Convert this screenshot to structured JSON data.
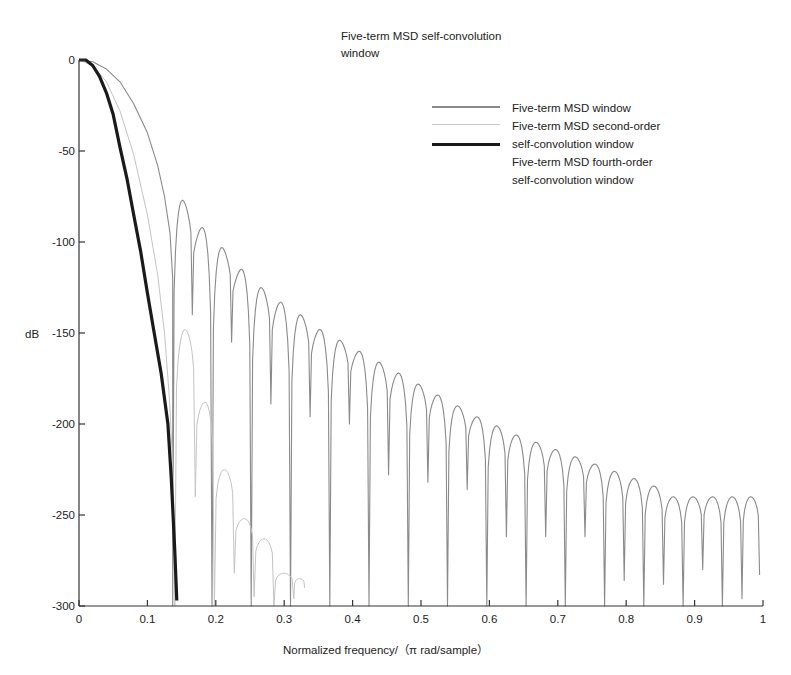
{
  "chart_data": {
    "type": "line",
    "title": "Five-term MSD self-convolution window",
    "xlabel": "Normalized frequency/（π rad/sample）",
    "ylabel": "dB",
    "xlim": [
      0,
      1
    ],
    "ylim": [
      -300,
      0
    ],
    "grid": false,
    "legend_position": "upper right",
    "x_ticks": [
      0,
      0.1,
      0.2,
      0.3,
      0.4,
      0.5,
      0.6,
      0.7,
      0.8,
      0.9,
      1
    ],
    "x_tick_labels": [
      "0",
      "0.1",
      "0.2",
      "0.3",
      "0.4",
      "0.5",
      "0.6",
      "0.7",
      "0.8",
      "0.9",
      "1"
    ],
    "y_ticks": [
      0,
      -50,
      -100,
      -150,
      -200,
      -250,
      -300
    ],
    "y_tick_labels": [
      "0",
      "-50",
      "-100",
      "-150",
      "-200",
      "-250",
      "-300"
    ],
    "series": [
      {
        "name": "Five-term MSD window",
        "color": "#8a8a8a",
        "line_width": 1.1,
        "mainlobe": {
          "x": [
            0,
            0.02,
            0.04,
            0.06,
            0.08,
            0.1,
            0.115,
            0.125,
            0.133,
            0.137
          ],
          "y": [
            0,
            -1,
            -5,
            -12,
            -24,
            -40,
            -58,
            -75,
            -95,
            -120
          ]
        },
        "sidelobes": {
          "nulls": [
            0.137,
            0.198,
            0.252,
            0.311,
            0.369,
            0.427,
            0.483,
            0.541,
            0.598,
            0.655,
            0.712,
            0.769,
            0.826,
            0.884,
            0.941
          ],
          "null_depths": [
            -300,
            -230,
            -140,
            -300,
            -200,
            -300,
            -215,
            -270,
            -300,
            -300,
            -300,
            -300,
            -300,
            -300,
            -300
          ],
          "peaks": [
            -77,
            -92,
            -103,
            -115,
            -125,
            -133,
            -140,
            -148,
            -154,
            -160,
            -166,
            -172,
            -178,
            -184,
            -190,
            -196,
            -201,
            -206,
            -210,
            -214,
            -218,
            -222,
            -226,
            -230,
            -234,
            -240
          ],
          "end_value": -283
        }
      },
      {
        "name": "Five-term MSD second-order self-convolution window",
        "color": "#c4c4c4",
        "line_width": 1.0,
        "mainlobe": {
          "x": [
            0,
            0.02,
            0.04,
            0.06,
            0.08,
            0.1,
            0.115,
            0.125,
            0.132,
            0.138
          ],
          "y": [
            0,
            -3,
            -12,
            -28,
            -52,
            -85,
            -118,
            -150,
            -185,
            -230
          ]
        },
        "sidelobes": {
          "x_peaks": [
            0.155,
            0.183,
            0.212,
            0.24,
            0.27,
            0.3,
            0.327
          ],
          "peaks": [
            -148,
            -188,
            -225,
            -252,
            -263,
            -282,
            -285
          ],
          "null_x": [
            0.14,
            0.17,
            0.198,
            0.227,
            0.256,
            0.285,
            0.314,
            0.33
          ],
          "null_depths": [
            -300,
            -240,
            -300,
            -282,
            -295,
            -300,
            -296,
            -290
          ]
        }
      },
      {
        "name": "Five-term MSD fourth-order self-convolution window",
        "color": "#1a1a1a",
        "line_width": 3.2,
        "x": [
          0,
          0.01,
          0.02,
          0.03,
          0.04,
          0.05,
          0.06,
          0.07,
          0.08,
          0.09,
          0.1,
          0.11,
          0.12,
          0.13,
          0.135,
          0.14,
          0.143
        ],
        "y": [
          0,
          0,
          -3,
          -9,
          -18,
          -30,
          -48,
          -65,
          -85,
          -105,
          -128,
          -150,
          -172,
          -200,
          -230,
          -270,
          -297
        ]
      }
    ]
  },
  "legend": {
    "items": [
      {
        "label": "Five-term MSD window",
        "color": "#8a8a8a",
        "width": 2.2
      },
      {
        "label": "Five-term MSD second-order",
        "color": "#c8c8c8",
        "width": 1.4
      },
      {
        "label": "self-convolution window",
        "color": "#1a1a1a",
        "width": 3.4
      },
      {
        "label": "Five-term MSD fourth-order",
        "color": null,
        "width": 0
      },
      {
        "label": "self-convolution window",
        "color": null,
        "width": 0
      }
    ]
  },
  "title_lines": [
    "Five-term MSD self-convolution",
    "window"
  ]
}
